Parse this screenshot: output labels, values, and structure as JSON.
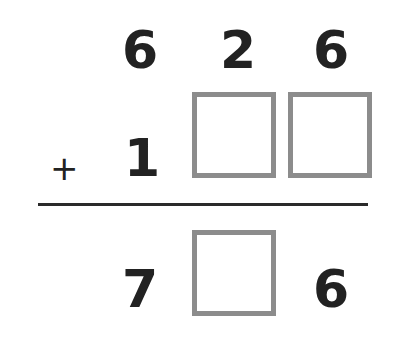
{
  "problem": {
    "type": "vertical-addition",
    "operator": "+",
    "row1": [
      "6",
      "2",
      "6"
    ],
    "row2": [
      "1",
      "",
      ""
    ],
    "result": [
      "7",
      "",
      "6"
    ],
    "blank_box_color": "#8c8c8c"
  }
}
